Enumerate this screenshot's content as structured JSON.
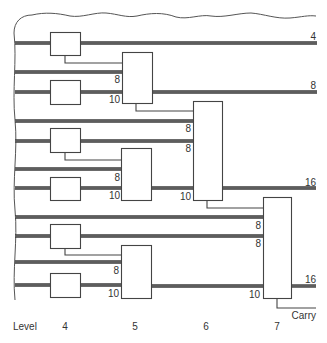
{
  "diagram": {
    "outputs": {
      "group1_sum": "4",
      "group1_level5_out": "8",
      "group2_level6_out": "16",
      "group3_level7_out": "16"
    },
    "level5_adder_1": {
      "in_a": "8",
      "in_b": "10"
    },
    "level6_adder": {
      "in_a": "8",
      "in_b": "8",
      "in_c": "10"
    },
    "level5_adder_2": {
      "in_a": "8",
      "in_b": "10"
    },
    "level7_adder": {
      "in_a": "8",
      "in_b": "8",
      "in_c": "10"
    },
    "level5_adder_3": {
      "in_a": "8",
      "in_b": "10"
    },
    "carry_label": "Carry",
    "level_axis": {
      "title": "Level",
      "levels": [
        "4",
        "5",
        "6",
        "7"
      ]
    }
  }
}
